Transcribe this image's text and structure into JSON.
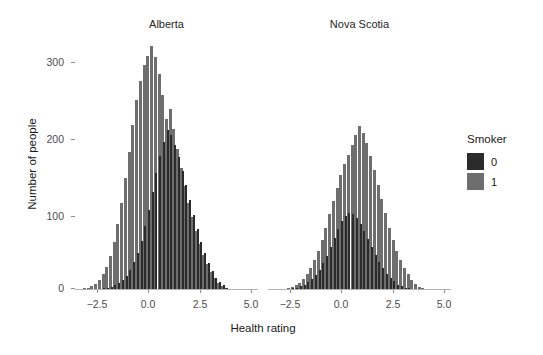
{
  "chart_data": {
    "type": "bar",
    "subtype": "overlapping-histogram-faceted",
    "title": "",
    "xlabel": "Health rating",
    "ylabel": "Number of people",
    "xlim": [
      -4.2,
      5.6
    ],
    "ylim": [
      0,
      320
    ],
    "xticks": [
      -2.5,
      0.0,
      2.5,
      5.0
    ],
    "xtick_labels": [
      "−2.5",
      "0.0",
      "2.5",
      "5.0"
    ],
    "yticks": [
      0,
      100,
      200,
      300
    ],
    "ytick_labels": [
      "0",
      "100",
      "200",
      "300"
    ],
    "grid": false,
    "legend": {
      "title": "Smoker",
      "position": "right",
      "entries": [
        {
          "label": "0",
          "color": "#2b2b2b"
        },
        {
          "label": "1",
          "color": "#6e6e6e"
        }
      ]
    },
    "facets": [
      {
        "label": "Alberta",
        "bin_centers": [
          -3.9,
          -3.7,
          -3.5,
          -3.3,
          -3.1,
          -2.9,
          -2.7,
          -2.5,
          -2.3,
          -2.1,
          -1.9,
          -1.7,
          -1.5,
          -1.3,
          -1.1,
          -0.9,
          -0.7,
          -0.5,
          -0.3,
          -0.1,
          0.1,
          0.3,
          0.5,
          0.7,
          0.9,
          1.1,
          1.3,
          1.5,
          1.7,
          1.9,
          2.1,
          2.3,
          2.5,
          2.7,
          2.9,
          3.1,
          3.3,
          3.5,
          3.7,
          3.9,
          4.1
        ],
        "series": [
          {
            "name": "0",
            "color": "#2b2b2b",
            "values": [
              0,
              0,
              0,
              0,
              1,
              1,
              2,
              3,
              4,
              6,
              9,
              13,
              18,
              26,
              36,
              48,
              63,
              82,
              103,
              126,
              150,
              172,
              190,
              205,
              198,
              186,
              170,
              152,
              134,
              115,
              96,
              78,
              62,
              47,
              34,
              24,
              16,
              10,
              6,
              3,
              1
            ]
          },
          {
            "name": "1",
            "color": "#6e6e6e",
            "values": [
              1,
              2,
              3,
              5,
              8,
              13,
              20,
              30,
              44,
              62,
              85,
              112,
              143,
              177,
              211,
              243,
              268,
              288,
              300,
              312,
              298,
              276,
              249,
              219,
              232,
              206,
              180,
              156,
              133,
              112,
              93,
              75,
              59,
              45,
              33,
              23,
              15,
              9,
              5,
              2,
              1
            ]
          }
        ]
      },
      {
        "label": "Nova Scotia",
        "bin_centers": [
          -3.9,
          -3.7,
          -3.5,
          -3.3,
          -3.1,
          -2.9,
          -2.7,
          -2.5,
          -2.3,
          -2.1,
          -1.9,
          -1.7,
          -1.5,
          -1.3,
          -1.1,
          -0.9,
          -0.7,
          -0.5,
          -0.3,
          -0.1,
          0.1,
          0.3,
          0.5,
          0.7,
          0.9,
          1.1,
          1.3,
          1.5,
          1.7,
          1.9,
          2.1,
          2.3,
          2.5,
          2.7,
          2.9,
          3.1,
          3.3,
          3.5,
          3.7,
          3.9,
          4.1
        ],
        "series": [
          {
            "name": "0",
            "color": "#2b2b2b",
            "values": [
              0,
              0,
              0,
              1,
              1,
              2,
              3,
              5,
              7,
              10,
              14,
              19,
              26,
              34,
              44,
              55,
              67,
              78,
              88,
              95,
              99,
              97,
              92,
              84,
              75,
              65,
              55,
              45,
              36,
              28,
              21,
              15,
              11,
              7,
              5,
              3,
              2,
              1,
              1,
              0,
              0
            ]
          },
          {
            "name": "1",
            "color": "#6e6e6e",
            "values": [
              0,
              0,
              1,
              1,
              2,
              4,
              6,
              9,
              14,
              20,
              28,
              38,
              50,
              64,
              80,
              97,
              114,
              131,
              147,
              161,
              173,
              186,
              198,
              210,
              201,
              188,
              172,
              154,
              135,
              116,
              98,
              80,
              64,
              50,
              38,
              28,
              20,
              13,
              8,
              4,
              2
            ]
          }
        ]
      }
    ]
  },
  "layout": {
    "panel1": {
      "left": 75,
      "top": 40,
      "width": 183,
      "height": 250
    },
    "panel2": {
      "left": 268,
      "top": 40,
      "width": 183,
      "height": 250
    }
  }
}
